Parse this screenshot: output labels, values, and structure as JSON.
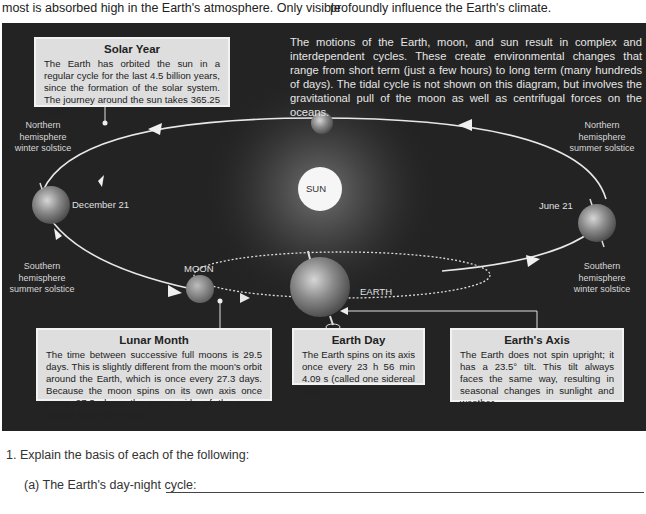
{
  "page": {
    "top_text_left": "most is absorbed high in the Earth's atmosphere. Only visible",
    "top_text_right": "profoundly influence the Earth's climate."
  },
  "diagram": {
    "intro": "The motions of the Earth, moon, and sun result in complex and interdependent cycles. These create environmental changes that range from short term (just a few hours) to long term (many hundreds of days). The tidal cycle is not shown on this diagram, but involves the gravitational pull of the moon as well as centrifugal forces on the oceans.",
    "bodies": {
      "sun": "SUN",
      "moon": "MOON",
      "earth": "EARTH"
    },
    "dates": {
      "december": "December 21",
      "june": "June 21"
    },
    "solstice_labels": {
      "left_top": [
        "Northern",
        "hemisphere",
        "winter solstice"
      ],
      "left_bottom": [
        "Southern",
        "hemisphere",
        "summer solstice"
      ],
      "right_top": [
        "Northern",
        "hemisphere",
        "summer solstice"
      ],
      "right_bottom": [
        "Southern",
        "hemisphere",
        "winter solstice"
      ]
    },
    "boxes": {
      "solar_year": {
        "title": "Solar Year",
        "body": "The Earth has orbited the sun in a regular cycle for the last 4.5 billion years, since the formation of the solar system. The journey around the sun takes 365.25 days."
      },
      "lunar_month": {
        "title": "Lunar Month",
        "body": "The time between successive full moons is 29.5 days. This is slightly different from the moon's orbit around the Earth, which is once every 27.3 days. Because the moon spins on its own axis once every 27.3 days, the same side of the moon always faces the Earth."
      },
      "earth_day": {
        "title": "Earth Day",
        "body": "The Earth spins on its axis once every 23 h 56 min 4.09 s (called one sidereal day)."
      },
      "earths_axis": {
        "title": "Earth's Axis",
        "body": "The Earth does not spin upright; it has a 23.5° tilt. This tilt always faces the same way, resulting in seasonal changes in sunlight and weather."
      }
    },
    "colors": {
      "background": "#232323",
      "box_fill": "#dedede",
      "orbit_line": "#e8e8e8",
      "sun": "#f6f6f6"
    }
  },
  "questions": {
    "q1": "1.  Explain the basis of each of the following:",
    "q1a": "(a) The Earth's day-night cycle:"
  }
}
